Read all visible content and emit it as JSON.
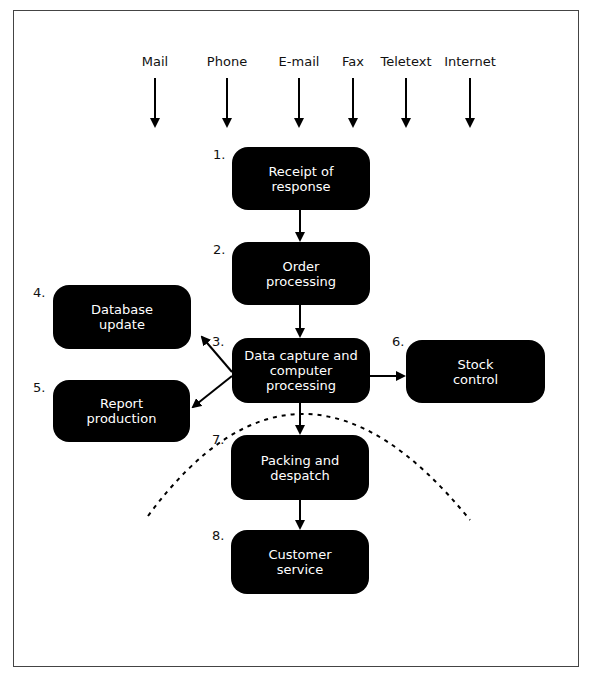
{
  "diagram": {
    "channels": [
      {
        "label": "Mail",
        "x": 155
      },
      {
        "label": "Phone",
        "x": 227
      },
      {
        "label": "E-mail",
        "x": 299
      },
      {
        "label": "Fax",
        "x": 380
      },
      {
        "label": "Teletext",
        "x": 406
      },
      {
        "label": "Internet",
        "x": 470
      }
    ],
    "steps": [
      {
        "num": "1.",
        "label": "Receipt of response"
      },
      {
        "num": "2.",
        "label": "Order processing"
      },
      {
        "num": "3.",
        "label": "Data capture and computer processing"
      },
      {
        "num": "4.",
        "label": "Database update"
      },
      {
        "num": "5.",
        "label": "Report production"
      },
      {
        "num": "6.",
        "label": "Stock control"
      },
      {
        "num": "7.",
        "label": "Packing and despatch"
      },
      {
        "num": "8.",
        "label": "Customer service"
      }
    ],
    "colors": {
      "box_fill": "#000000",
      "box_text": "#ffffff",
      "line": "#000000"
    }
  }
}
